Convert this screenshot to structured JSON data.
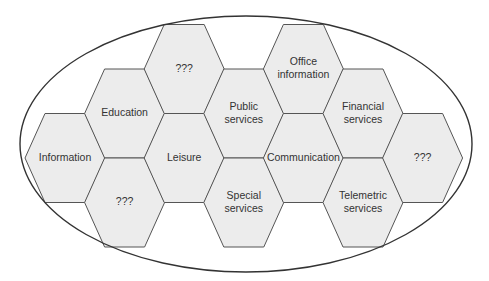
{
  "diagram": {
    "type": "hexagon-cluster",
    "container": "ellipse",
    "colors": {
      "hex_fill": "#ececec",
      "hex_stroke": "#555555",
      "ellipse_stroke": "#333333",
      "text": "#333333"
    },
    "cells": [
      {
        "id": "information",
        "lines": [
          "Information"
        ],
        "col": 0,
        "row": 2
      },
      {
        "id": "education",
        "lines": [
          "Education"
        ],
        "col": 1,
        "row": 1
      },
      {
        "id": "unknown-bottom-left",
        "lines": [
          "???"
        ],
        "col": 1,
        "row": 3
      },
      {
        "id": "unknown-top",
        "lines": [
          "???"
        ],
        "col": 2,
        "row": 0
      },
      {
        "id": "leisure",
        "lines": [
          "Leisure"
        ],
        "col": 2,
        "row": 2
      },
      {
        "id": "public-services",
        "lines": [
          "Public",
          "services"
        ],
        "col": 3,
        "row": 1
      },
      {
        "id": "special-services",
        "lines": [
          "Special",
          "services"
        ],
        "col": 3,
        "row": 3
      },
      {
        "id": "office-information",
        "lines": [
          "Office",
          "information"
        ],
        "col": 4,
        "row": 0
      },
      {
        "id": "communication",
        "lines": [
          "Communication"
        ],
        "col": 4,
        "row": 2
      },
      {
        "id": "financial-services",
        "lines": [
          "Financial",
          "services"
        ],
        "col": 5,
        "row": 1
      },
      {
        "id": "telemetric-services",
        "lines": [
          "Telemetric",
          "services"
        ],
        "col": 5,
        "row": 3
      },
      {
        "id": "unknown-right",
        "lines": [
          "???"
        ],
        "col": 6,
        "row": 2
      }
    ]
  }
}
